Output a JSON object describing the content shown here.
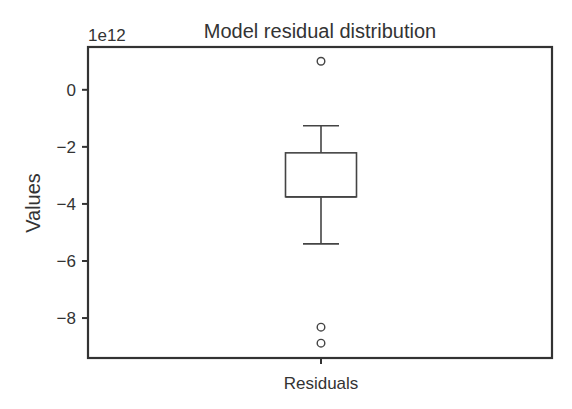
{
  "chart_data": {
    "type": "box",
    "title": "Model residual distribution",
    "xlabel": "",
    "ylabel": "Values",
    "y_offset_label": "1e12",
    "y_scale": 1000000000000.0,
    "categories": [
      "Residuals"
    ],
    "ylim": [
      -9.4,
      1.5
    ],
    "yticks": [
      0,
      -2,
      -4,
      -6,
      -8
    ],
    "ytick_labels": [
      "0",
      "−2",
      "−4",
      "−6",
      "−8"
    ],
    "grid": false,
    "legend": null,
    "boxes": [
      {
        "name": "Residuals",
        "whisker_high": -1.26,
        "q3": -2.21,
        "median": -3.75,
        "q1": -3.75,
        "whisker_low": -5.4,
        "outliers": [
          1.0,
          -8.32,
          -8.88
        ]
      }
    ]
  },
  "colors": {
    "axis": "#333333",
    "box_line": "#444444",
    "text": "#333333"
  }
}
